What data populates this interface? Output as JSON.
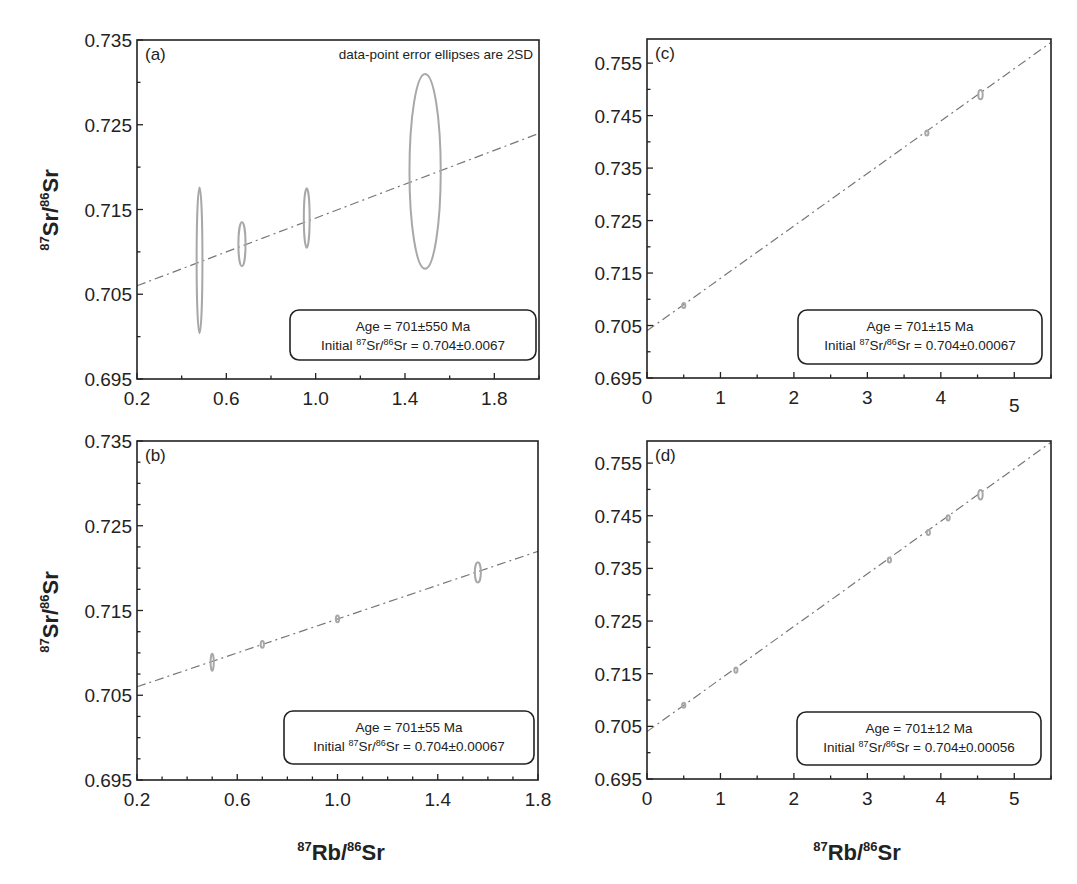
{
  "figure": {
    "y_axis_title": {
      "iso_top": "87",
      "elem_top": "Sr/",
      "iso_bot": "86",
      "elem_bot": "Sr"
    },
    "x_axis_title": {
      "iso_top": "87",
      "elem_top": "Rb/",
      "iso_bot": "86",
      "elem_bot": "Sr"
    },
    "note": "data-point error ellipses are 2SD"
  },
  "chart_data": [
    {
      "panel": "(a)",
      "type": "scatter",
      "title": "",
      "xlabel": "87Rb/86Sr",
      "ylabel": "87Sr/86Sr",
      "xlim": [
        0.2,
        2.0
      ],
      "ylim": [
        0.695,
        0.735
      ],
      "xticks": [
        0.2,
        0.6,
        1.0,
        1.4,
        1.8
      ],
      "xtick_labels": [
        "0.2",
        "0.6",
        "1.0",
        "1.4",
        "1.8"
      ],
      "xminor": 0.2,
      "yticks": [
        0.695,
        0.705,
        0.715,
        0.725,
        0.735
      ],
      "ytick_labels": [
        "0.695",
        "0.705",
        "0.715",
        "0.725",
        "0.735"
      ],
      "yminor": 0.005,
      "grid": false,
      "annotation": "data-point error ellipses are 2SD",
      "points": [
        {
          "x": 0.48,
          "y": 0.709,
          "sx": 0.013,
          "sy": 0.0086
        },
        {
          "x": 0.67,
          "y": 0.7109,
          "sx": 0.016,
          "sy": 0.0026
        },
        {
          "x": 0.96,
          "y": 0.714,
          "sx": 0.013,
          "sy": 0.0035
        },
        {
          "x": 1.49,
          "y": 0.7195,
          "sx": 0.07,
          "sy": 0.0115
        }
      ],
      "fit": {
        "intercept": 0.704,
        "slope": 0.00999
      },
      "legend": {
        "age": "Age = 701±550 Ma",
        "initial_prefix": "Initial ",
        "iso1": "87",
        "e1": "Sr/",
        "iso2": "86",
        "e2": "Sr = 0.704±0.0067"
      },
      "legend_position": "lower right"
    },
    {
      "panel": "(b)",
      "type": "scatter",
      "title": "",
      "xlabel": "87Rb/86Sr",
      "ylabel": "87Sr/86Sr",
      "xlim": [
        0.2,
        1.8
      ],
      "ylim": [
        0.695,
        0.735
      ],
      "xticks": [
        0.2,
        0.6,
        1.0,
        1.4,
        1.8
      ],
      "xtick_labels": [
        "0.2",
        "0.6",
        "1.0",
        "1.4",
        "1.8"
      ],
      "xminor": 0.1,
      "yticks": [
        0.695,
        0.705,
        0.715,
        0.725,
        0.735
      ],
      "ytick_labels": [
        "0.695",
        "0.705",
        "0.715",
        "0.725",
        "0.735"
      ],
      "yminor": 0.0025,
      "grid": false,
      "points": [
        {
          "x": 0.5,
          "y": 0.7089,
          "sx": 0.004,
          "sy": 0.001
        },
        {
          "x": 0.7,
          "y": 0.711,
          "sx": 0.004,
          "sy": 0.0004
        },
        {
          "x": 1.0,
          "y": 0.714,
          "sx": 0.004,
          "sy": 0.0004
        },
        {
          "x": 1.56,
          "y": 0.7195,
          "sx": 0.012,
          "sy": 0.0012
        }
      ],
      "fit": {
        "intercept": 0.704,
        "slope": 0.00999
      },
      "legend": {
        "age": "Age = 701±55 Ma",
        "initial_prefix": "Initial ",
        "iso1": "87",
        "e1": "Sr/",
        "iso2": "86",
        "e2": "Sr = 0.704±0.00067"
      },
      "legend_position": "lower right"
    },
    {
      "panel": "(c)",
      "type": "scatter",
      "title": "",
      "xlabel": "87Rb/86Sr",
      "ylabel": "87Sr/86Sr",
      "xlim": [
        0,
        5.5
      ],
      "ylim": [
        0.695,
        0.7596
      ],
      "xticks": [
        0,
        1,
        2,
        3,
        4,
        5
      ],
      "xtick_labels": [
        "0",
        "1",
        "2",
        "3",
        "4",
        "5"
      ],
      "xminor": 0.5,
      "yticks": [
        0.695,
        0.705,
        0.715,
        0.725,
        0.735,
        0.745,
        0.755
      ],
      "ytick_labels": [
        "0.695",
        "0.705",
        "0.715",
        "0.725",
        "0.735",
        "0.745",
        "0.755"
      ],
      "yminor": 0.005,
      "grid": false,
      "points": [
        {
          "x": 0.5,
          "y": 0.7088,
          "sx": 0.02,
          "sy": 0.0004
        },
        {
          "x": 3.81,
          "y": 0.7417,
          "sx": 0.02,
          "sy": 0.0003
        },
        {
          "x": 4.54,
          "y": 0.749,
          "sx": 0.03,
          "sy": 0.0009
        }
      ],
      "fit": {
        "intercept": 0.704,
        "slope": 0.00999
      },
      "legend": {
        "age": "Age = 701±15 Ma",
        "initial_prefix": "Initial ",
        "iso1": "87",
        "e1": "Sr/",
        "iso2": "86",
        "e2": "Sr = 0.704±0.00067"
      },
      "legend_position": "lower right"
    },
    {
      "panel": "(d)",
      "type": "scatter",
      "title": "",
      "xlabel": "87Rb/86Sr",
      "ylabel": "87Sr/86Sr",
      "xlim": [
        0,
        5.5
      ],
      "ylim": [
        0.695,
        0.7592
      ],
      "xticks": [
        0,
        1,
        2,
        3,
        4,
        5
      ],
      "xtick_labels": [
        "0",
        "1",
        "2",
        "3",
        "4",
        "5"
      ],
      "xminor": 0.5,
      "yticks": [
        0.695,
        0.705,
        0.715,
        0.725,
        0.735,
        0.745,
        0.755
      ],
      "ytick_labels": [
        "0.695",
        "0.705",
        "0.715",
        "0.725",
        "0.735",
        "0.745",
        "0.755"
      ],
      "yminor": 0.005,
      "grid": false,
      "points": [
        {
          "x": 0.5,
          "y": 0.709,
          "sx": 0.02,
          "sy": 0.0004
        },
        {
          "x": 1.21,
          "y": 0.7157,
          "sx": 0.02,
          "sy": 0.0005
        },
        {
          "x": 3.3,
          "y": 0.7366,
          "sx": 0.02,
          "sy": 0.0003
        },
        {
          "x": 3.83,
          "y": 0.7418,
          "sx": 0.02,
          "sy": 0.0002
        },
        {
          "x": 4.1,
          "y": 0.7446,
          "sx": 0.02,
          "sy": 0.0005
        },
        {
          "x": 4.54,
          "y": 0.749,
          "sx": 0.03,
          "sy": 0.0009
        }
      ],
      "fit": {
        "intercept": 0.704,
        "slope": 0.00999
      },
      "legend": {
        "age": "Age = 701±12 Ma",
        "initial_prefix": "Initial ",
        "iso1": "87",
        "e1": "Sr/",
        "iso2": "86",
        "e2": "Sr = 0.704±0.00056"
      },
      "legend_position": "lower right"
    }
  ],
  "layout_px": [
    {
      "left": 137,
      "top": 40,
      "right": 539,
      "bottom": 379,
      "legend": {
        "x": 290,
        "y": 310,
        "w": 246,
        "h": 50
      },
      "note": true
    },
    {
      "left": 137,
      "top": 441,
      "right": 538,
      "bottom": 780,
      "legend": {
        "x": 284,
        "y": 711,
        "w": 250,
        "h": 53
      },
      "note": false
    },
    {
      "left": 647,
      "top": 39,
      "right": 1051,
      "bottom": 378,
      "legend": {
        "x": 798,
        "y": 310,
        "w": 244,
        "h": 54
      },
      "note": false
    },
    {
      "left": 647,
      "top": 441,
      "right": 1051,
      "bottom": 779,
      "legend": {
        "x": 797,
        "y": 712,
        "w": 244,
        "h": 53
      },
      "note": false
    }
  ]
}
